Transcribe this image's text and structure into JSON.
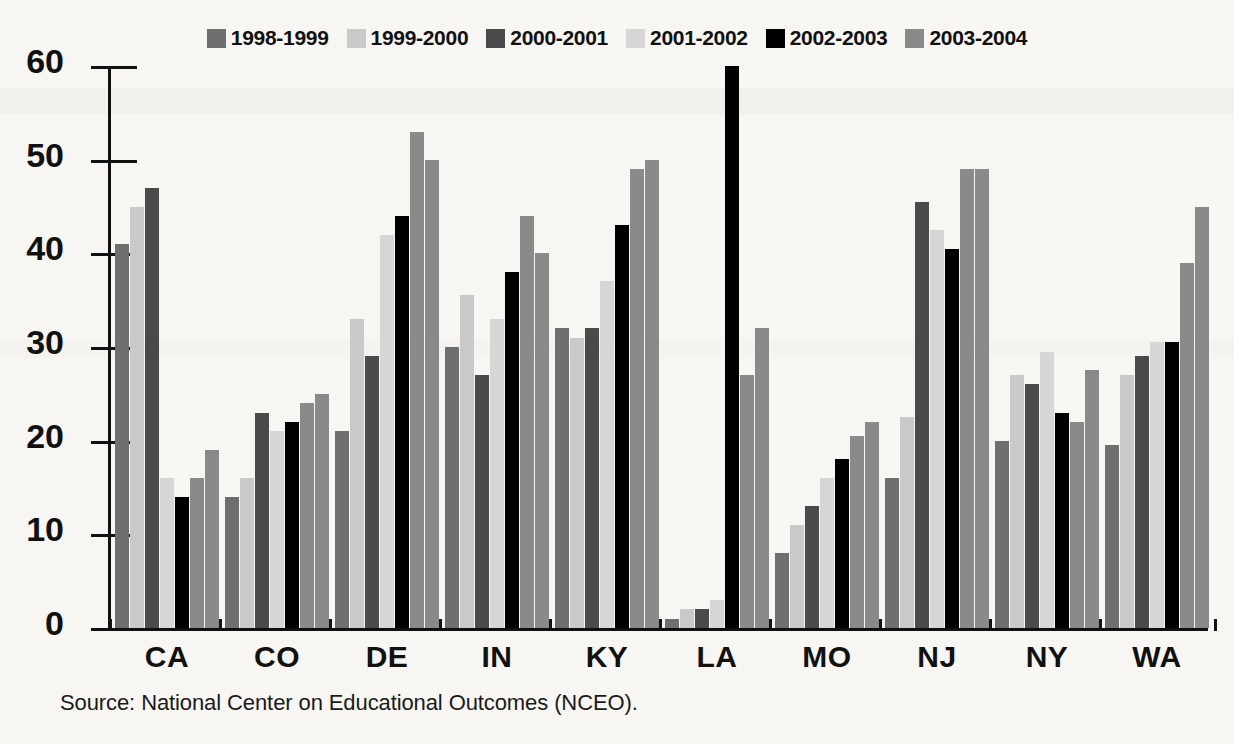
{
  "legend": {
    "position": "top-center",
    "items": [
      {
        "label": "1998-1999",
        "color": "#6f6f6f"
      },
      {
        "label": "1999-2000",
        "color": "#c9c9c9"
      },
      {
        "label": "2000-2001",
        "color": "#4a4a4a"
      },
      {
        "label": "2001-2002",
        "color": "#d6d6d6"
      },
      {
        "label": "2002-2003",
        "color": "#000000"
      },
      {
        "label": "2003-2004",
        "color": "#8a8a8a"
      }
    ]
  },
  "source": {
    "text": "Source:  National Center on Educational Outcomes (NCEO)."
  },
  "axis": {
    "y_ticks": [
      "0",
      "10",
      "20",
      "30",
      "40",
      "50",
      "60"
    ],
    "x_categories": [
      "CA",
      "CO",
      "DE",
      "IN",
      "KY",
      "LA",
      "MO",
      "NJ",
      "NY",
      "WA"
    ]
  },
  "chart_data": {
    "type": "bar",
    "title": "",
    "subtitle": "",
    "xlabel": "",
    "ylabel": "",
    "ylim": [
      0,
      60
    ],
    "ytick_step": 10,
    "grid": false,
    "legend_position": "top-center",
    "categories": [
      "CA",
      "CO",
      "DE",
      "IN",
      "KY",
      "LA",
      "MO",
      "NJ",
      "NY",
      "WA"
    ],
    "series": [
      {
        "name": "1998-1999",
        "color": "#6f6f6f",
        "values": [
          41,
          14,
          21,
          30,
          32,
          1,
          8,
          16,
          20,
          19.5
        ]
      },
      {
        "name": "1999-2000",
        "color": "#c9c9c9",
        "values": [
          45,
          16,
          33,
          35.5,
          31,
          2,
          11,
          22.5,
          27,
          27
        ]
      },
      {
        "name": "2000-2001",
        "color": "#4a4a4a",
        "values": [
          47,
          23,
          29,
          27,
          32,
          2,
          13,
          45.5,
          26,
          29
        ]
      },
      {
        "name": "2001-2002",
        "color": "#d6d6d6",
        "values": [
          16,
          21,
          42,
          33,
          37,
          3,
          16,
          42.5,
          29.5,
          30.5
        ]
      },
      {
        "name": "2002-2003",
        "color": "#000000",
        "values": [
          14,
          22,
          44,
          38,
          43,
          60,
          18,
          40.5,
          23,
          30.5
        ]
      },
      {
        "name": "2003-2004",
        "color": "#8a8a8a",
        "values": [
          16,
          24,
          53,
          44,
          49,
          27,
          20.5,
          49,
          22,
          39
        ]
      },
      {
        "name": "2004-2005",
        "color": "#8a8a8a",
        "values": [
          19,
          25,
          50,
          40,
          50,
          32,
          22,
          49,
          27.5,
          45
        ]
      }
    ]
  }
}
